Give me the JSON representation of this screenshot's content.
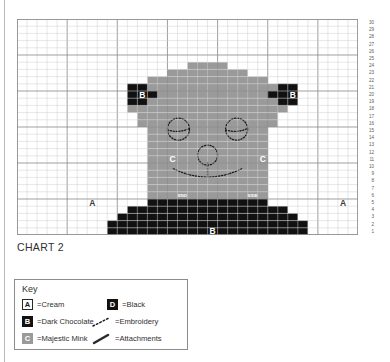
{
  "chart": {
    "caption": "CHART 2",
    "columns": 34,
    "rows": 30,
    "row_numbers": [
      30,
      29,
      28,
      27,
      26,
      25,
      24,
      23,
      22,
      21,
      20,
      19,
      18,
      17,
      16,
      15,
      14,
      13,
      12,
      11,
      10,
      9,
      8,
      7,
      6,
      5,
      4,
      3,
      2,
      1
    ],
    "colors": {
      "background_cream": "#ffffff",
      "grid_line": "#cfcfcf",
      "grid_line_major": "#8f8f8f",
      "majestic_mink": "#9a9a9a",
      "dark_chocolate": "#111111",
      "black": "#111111",
      "embroidery": "#1a1a1a"
    },
    "cell_labels": [
      {
        "name": "ear-left-label",
        "letter": "B",
        "col": 12,
        "row": 20,
        "tone": "on-dark"
      },
      {
        "name": "ear-right-label",
        "letter": "B",
        "col": 27,
        "row": 20,
        "tone": "on-dark"
      },
      {
        "name": "cheek-left-label",
        "letter": "C",
        "col": 15,
        "row": 11,
        "tone": "on-dark"
      },
      {
        "name": "cheek-right-label",
        "letter": "C",
        "col": 24,
        "row": 11,
        "tone": "on-dark"
      },
      {
        "name": "background-left-label",
        "letter": "A",
        "col": 7,
        "row": 5,
        "tone": "on-light"
      },
      {
        "name": "background-right-label",
        "letter": "A",
        "col": 32,
        "row": 5,
        "tone": "on-light"
      },
      {
        "name": "chest-label",
        "letter": "B",
        "col": 19,
        "row": 1,
        "tone": "on-dark"
      }
    ],
    "tiny_labels": [
      {
        "name": "end-marker",
        "text": "END",
        "col": 16,
        "row": 6
      },
      {
        "name": "side-marker",
        "text": "SIDE",
        "col": 23,
        "row": 6
      }
    ]
  },
  "key": {
    "title": "Key",
    "entries": [
      {
        "symbol": "A",
        "swatch": "swatch-a",
        "label": "=Cream",
        "name": "key-entry-cream"
      },
      {
        "symbol": "B",
        "swatch": "swatch-b",
        "label": "=Dark Chocolate",
        "name": "key-entry-dark-chocolate"
      },
      {
        "symbol": "C",
        "swatch": "swatch-c",
        "label": "=Majestic Mink",
        "name": "key-entry-majestic-mink"
      },
      {
        "symbol": "D",
        "swatch": "swatch-d",
        "label": "=Black",
        "name": "key-entry-black"
      }
    ],
    "glyph_entries": [
      {
        "glyph": "embroidery-dashed-line-icon",
        "label": "=Embroidery",
        "name": "key-entry-embroidery"
      },
      {
        "glyph": "attachment-solid-line-icon",
        "label": "=Attachments",
        "name": "key-entry-attachments"
      }
    ]
  }
}
